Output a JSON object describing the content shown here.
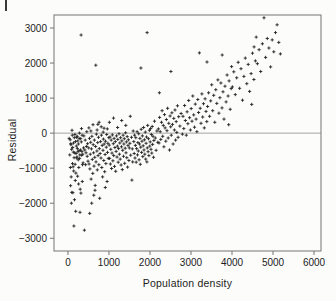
{
  "figure": {
    "background": "#fcfcfb",
    "corner_mark": ""
  },
  "chart_data": {
    "type": "scatter",
    "title": "",
    "xlabel": "Population density",
    "ylabel": "Residual",
    "xlim": [
      -340,
      6170
    ],
    "ylim": [
      -3363,
      3371
    ],
    "x_ticks": [
      0,
      1000,
      2000,
      3000,
      4000,
      5000,
      6000
    ],
    "y_ticks": [
      -3000,
      -2000,
      -1000,
      0,
      1000,
      2000,
      3000
    ],
    "x_tick_labels": [
      "0",
      "1000",
      "2000",
      "3000",
      "4000",
      "5000",
      "6000"
    ],
    "y_tick_labels": [
      "−3000",
      "−2000",
      "−1000",
      "0",
      "1000",
      "2000",
      "3000"
    ],
    "reference_line_y": 0,
    "grid": false,
    "legend": null,
    "marker": "plus",
    "marker_color": "#232323",
    "axis_color": "#757575",
    "text_color": "#1c1c1c",
    "points": [
      [
        30,
        -150
      ],
      [
        45,
        -620
      ],
      [
        55,
        -190
      ],
      [
        60,
        -980
      ],
      [
        65,
        -1500
      ],
      [
        70,
        -300
      ],
      [
        75,
        -330
      ],
      [
        80,
        -1250
      ],
      [
        85,
        -2000
      ],
      [
        90,
        -460
      ],
      [
        95,
        -1690
      ],
      [
        100,
        80
      ],
      [
        105,
        -60
      ],
      [
        110,
        -870
      ],
      [
        115,
        -410
      ],
      [
        120,
        -1700
      ],
      [
        125,
        -960
      ],
      [
        130,
        -540
      ],
      [
        135,
        -280
      ],
      [
        140,
        -1080
      ],
      [
        145,
        -2650
      ],
      [
        150,
        -700
      ],
      [
        155,
        -130
      ],
      [
        160,
        -1900
      ],
      [
        165,
        -560
      ],
      [
        170,
        -40
      ],
      [
        175,
        -890
      ],
      [
        180,
        -1350
      ],
      [
        185,
        -240
      ],
      [
        190,
        -2230
      ],
      [
        195,
        -1140
      ],
      [
        200,
        -580
      ],
      [
        205,
        -370
      ],
      [
        210,
        -120
      ],
      [
        215,
        -710
      ],
      [
        220,
        -680
      ],
      [
        225,
        -90
      ],
      [
        230,
        -440
      ],
      [
        235,
        -1230
      ],
      [
        240,
        -220
      ],
      [
        245,
        -530
      ],
      [
        250,
        -760
      ],
      [
        255,
        -310
      ],
      [
        260,
        -1450
      ],
      [
        265,
        -980
      ],
      [
        270,
        -500
      ],
      [
        275,
        -150
      ],
      [
        280,
        0
      ],
      [
        285,
        -720
      ],
      [
        290,
        -620
      ],
      [
        295,
        -2260
      ],
      [
        300,
        -1600
      ],
      [
        305,
        -480
      ],
      [
        310,
        -160
      ],
      [
        315,
        -1710
      ],
      [
        320,
        2800
      ],
      [
        325,
        -250
      ],
      [
        330,
        130
      ],
      [
        335,
        -630
      ],
      [
        340,
        -520
      ],
      [
        345,
        -60
      ],
      [
        350,
        -1380
      ],
      [
        355,
        -900
      ],
      [
        360,
        -600
      ],
      [
        370,
        -850
      ],
      [
        380,
        -420
      ],
      [
        390,
        -80
      ],
      [
        400,
        -2770
      ],
      [
        410,
        -480
      ],
      [
        420,
        -200
      ],
      [
        430,
        -900
      ],
      [
        440,
        -560
      ],
      [
        450,
        -380
      ],
      [
        460,
        40
      ],
      [
        470,
        -660
      ],
      [
        480,
        -300
      ],
      [
        490,
        -800
      ],
      [
        505,
        -420
      ],
      [
        510,
        150
      ],
      [
        515,
        -880
      ],
      [
        525,
        -150
      ],
      [
        530,
        -2290
      ],
      [
        535,
        -1020
      ],
      [
        545,
        -600
      ],
      [
        555,
        -260
      ],
      [
        560,
        60
      ],
      [
        565,
        -1310
      ],
      [
        575,
        -450
      ],
      [
        580,
        -2000
      ],
      [
        585,
        -90
      ],
      [
        595,
        -750
      ],
      [
        605,
        -1150
      ],
      [
        610,
        240
      ],
      [
        615,
        -330
      ],
      [
        625,
        -560
      ],
      [
        630,
        -1770
      ],
      [
        635,
        -940
      ],
      [
        645,
        -200
      ],
      [
        655,
        -690
      ],
      [
        660,
        -1630
      ],
      [
        665,
        -1490
      ],
      [
        675,
        -380
      ],
      [
        680,
        1940
      ],
      [
        685,
        -820
      ],
      [
        695,
        -30
      ],
      [
        705,
        -510
      ],
      [
        710,
        90
      ],
      [
        715,
        -1050
      ],
      [
        725,
        -270
      ],
      [
        730,
        250
      ],
      [
        735,
        -640
      ],
      [
        745,
        -120
      ],
      [
        755,
        -900
      ],
      [
        760,
        310
      ],
      [
        765,
        -440
      ],
      [
        775,
        -1860
      ],
      [
        785,
        -580
      ],
      [
        795,
        -240
      ],
      [
        805,
        -710
      ],
      [
        810,
        180
      ],
      [
        815,
        -60
      ],
      [
        825,
        -980
      ],
      [
        835,
        -350
      ],
      [
        845,
        -1250
      ],
      [
        855,
        -490
      ],
      [
        860,
        30
      ],
      [
        865,
        -170
      ],
      [
        875,
        -780
      ],
      [
        880,
        140
      ],
      [
        885,
        -310
      ],
      [
        895,
        -1100
      ],
      [
        905,
        -610
      ],
      [
        910,
        -1550
      ],
      [
        915,
        -230
      ],
      [
        925,
        -870
      ],
      [
        935,
        -400
      ],
      [
        945,
        -40
      ],
      [
        955,
        -1380
      ],
      [
        960,
        120
      ],
      [
        965,
        -550
      ],
      [
        975,
        -290
      ],
      [
        985,
        -720
      ],
      [
        995,
        -130
      ],
      [
        1005,
        -340
      ],
      [
        1010,
        310
      ],
      [
        1015,
        -720
      ],
      [
        1025,
        -110
      ],
      [
        1035,
        -880
      ],
      [
        1045,
        -460
      ],
      [
        1055,
        -200
      ],
      [
        1065,
        -1010
      ],
      [
        1075,
        -570
      ],
      [
        1085,
        -50
      ],
      [
        1095,
        -790
      ],
      [
        1105,
        -300
      ],
      [
        1110,
        430
      ],
      [
        1115,
        -640
      ],
      [
        1125,
        -150
      ],
      [
        1135,
        -950
      ],
      [
        1145,
        -410
      ],
      [
        1155,
        -240
      ],
      [
        1165,
        -1090
      ],
      [
        1175,
        -520
      ],
      [
        1185,
        -80
      ],
      [
        1195,
        -680
      ],
      [
        1205,
        -370
      ],
      [
        1210,
        160
      ],
      [
        1215,
        -180
      ],
      [
        1225,
        -830
      ],
      [
        1235,
        -440
      ],
      [
        1245,
        -20
      ],
      [
        1255,
        -600
      ],
      [
        1265,
        -280
      ],
      [
        1275,
        -740
      ],
      [
        1285,
        -130
      ],
      [
        1295,
        -910
      ],
      [
        1305,
        -390
      ],
      [
        1310,
        360
      ],
      [
        1315,
        -220
      ],
      [
        1325,
        -1040
      ],
      [
        1335,
        -490
      ],
      [
        1345,
        -60
      ],
      [
        1355,
        -660
      ],
      [
        1365,
        -310
      ],
      [
        1375,
        -160
      ],
      [
        1385,
        -860
      ],
      [
        1395,
        -430
      ],
      [
        1405,
        10
      ],
      [
        1410,
        220
      ],
      [
        1415,
        -560
      ],
      [
        1425,
        -250
      ],
      [
        1435,
        -700
      ],
      [
        1445,
        -100
      ],
      [
        1455,
        -970
      ],
      [
        1465,
        -350
      ],
      [
        1475,
        -190
      ],
      [
        1485,
        -780
      ],
      [
        1495,
        -420
      ],
      [
        1510,
        -290
      ],
      [
        1520,
        480
      ],
      [
        1530,
        -630
      ],
      [
        1550,
        -120
      ],
      [
        1560,
        -1340
      ],
      [
        1570,
        -450
      ],
      [
        1580,
        -820
      ],
      [
        1590,
        60
      ],
      [
        1605,
        -240
      ],
      [
        1615,
        -580
      ],
      [
        1625,
        -60
      ],
      [
        1635,
        -710
      ],
      [
        1645,
        -350
      ],
      [
        1655,
        -130
      ],
      [
        1665,
        -830
      ],
      [
        1675,
        -440
      ],
      [
        1685,
        40
      ],
      [
        1695,
        -620
      ],
      [
        1705,
        -270
      ],
      [
        1715,
        -510
      ],
      [
        1725,
        -20
      ],
      [
        1735,
        -760
      ],
      [
        1745,
        -310
      ],
      [
        1755,
        -150
      ],
      [
        1765,
        -890
      ],
      [
        1775,
        -400
      ],
      [
        1780,
        1860
      ],
      [
        1785,
        110
      ],
      [
        1795,
        -550
      ],
      [
        1805,
        -230
      ],
      [
        1815,
        -80
      ],
      [
        1825,
        -670
      ],
      [
        1835,
        -360
      ],
      [
        1845,
        160
      ],
      [
        1855,
        -480
      ],
      [
        1865,
        -190
      ],
      [
        1875,
        -600
      ],
      [
        1885,
        30
      ],
      [
        1895,
        -740
      ],
      [
        1905,
        -290
      ],
      [
        1915,
        -110
      ],
      [
        1925,
        -820
      ],
      [
        1930,
        2870
      ],
      [
        1935,
        -420
      ],
      [
        1945,
        220
      ],
      [
        1955,
        -530
      ],
      [
        1965,
        -160
      ],
      [
        1975,
        -640
      ],
      [
        1985,
        80
      ],
      [
        1995,
        -370
      ],
      [
        2005,
        -250
      ],
      [
        2015,
        130
      ],
      [
        2025,
        -460
      ],
      [
        2035,
        -40
      ],
      [
        2045,
        -570
      ],
      [
        2055,
        190
      ],
      [
        2065,
        -320
      ],
      [
        2075,
        -90
      ],
      [
        2085,
        -690
      ],
      [
        2095,
        -210
      ],
      [
        2110,
        340
      ],
      [
        2130,
        -140
      ],
      [
        2150,
        -490
      ],
      [
        2170,
        60
      ],
      [
        2190,
        -260
      ],
      [
        2205,
        120
      ],
      [
        2220,
        -280
      ],
      [
        2230,
        1150
      ],
      [
        2235,
        450
      ],
      [
        2250,
        40
      ],
      [
        2265,
        -180
      ],
      [
        2280,
        310
      ],
      [
        2295,
        640
      ],
      [
        2310,
        -90
      ],
      [
        2325,
        220
      ],
      [
        2340,
        -390
      ],
      [
        2355,
        530
      ],
      [
        2370,
        150
      ],
      [
        2385,
        -230
      ],
      [
        2400,
        390
      ],
      [
        2415,
        70
      ],
      [
        2430,
        710
      ],
      [
        2445,
        -140
      ],
      [
        2460,
        280
      ],
      [
        2475,
        -480
      ],
      [
        2490,
        490
      ],
      [
        2505,
        180
      ],
      [
        2510,
        1760
      ],
      [
        2520,
        -60
      ],
      [
        2535,
        580
      ],
      [
        2550,
        250
      ],
      [
        2565,
        -310
      ],
      [
        2580,
        420
      ],
      [
        2595,
        90
      ],
      [
        2610,
        660
      ],
      [
        2625,
        -200
      ],
      [
        2640,
        330
      ],
      [
        2655,
        20
      ],
      [
        2670,
        780
      ],
      [
        2685,
        -120
      ],
      [
        2700,
        470
      ],
      [
        2730,
        200
      ],
      [
        2760,
        560
      ],
      [
        2790,
        -30
      ],
      [
        2805,
        480
      ],
      [
        2825,
        130
      ],
      [
        2845,
        790
      ],
      [
        2865,
        360
      ],
      [
        2885,
        -60
      ],
      [
        2905,
        610
      ],
      [
        2925,
        270
      ],
      [
        2945,
        930
      ],
      [
        2965,
        440
      ],
      [
        2985,
        90
      ],
      [
        3005,
        700
      ],
      [
        3025,
        340
      ],
      [
        3045,
        1060
      ],
      [
        3065,
        520
      ],
      [
        3085,
        170
      ],
      [
        3105,
        830
      ],
      [
        3125,
        400
      ],
      [
        3145,
        40
      ],
      [
        3165,
        960
      ],
      [
        3185,
        590
      ],
      [
        3205,
        2290
      ],
      [
        3225,
        710
      ],
      [
        3245,
        280
      ],
      [
        3265,
        1120
      ],
      [
        3285,
        460
      ],
      [
        3305,
        840
      ],
      [
        3325,
        150
      ],
      [
        3345,
        980
      ],
      [
        3365,
        620
      ],
      [
        3385,
        330
      ],
      [
        3390,
        2030
      ],
      [
        3405,
        760
      ],
      [
        3430,
        1150
      ],
      [
        3455,
        480
      ],
      [
        3480,
        920
      ],
      [
        3505,
        1380
      ],
      [
        3530,
        640
      ],
      [
        3555,
        1080
      ],
      [
        3580,
        310
      ],
      [
        3605,
        1240
      ],
      [
        3630,
        850
      ],
      [
        3655,
        1520
      ],
      [
        3680,
        570
      ],
      [
        3705,
        1010
      ],
      [
        3730,
        1430
      ],
      [
        3755,
        720
      ],
      [
        3760,
        2230
      ],
      [
        3780,
        1180
      ],
      [
        3805,
        400
      ],
      [
        3830,
        1340
      ],
      [
        3855,
        890
      ],
      [
        3880,
        1660
      ],
      [
        3905,
        1060
      ],
      [
        3920,
        240
      ],
      [
        3930,
        1490
      ],
      [
        3955,
        680
      ],
      [
        3980,
        1270
      ],
      [
        3990,
        1900
      ],
      [
        4010,
        1320
      ],
      [
        4045,
        1750
      ],
      [
        4080,
        1100
      ],
      [
        4115,
        1580
      ],
      [
        4150,
        2020
      ],
      [
        4185,
        1280
      ],
      [
        4220,
        1840
      ],
      [
        4255,
        940
      ],
      [
        4290,
        1620
      ],
      [
        4325,
        2140
      ],
      [
        4360,
        1410
      ],
      [
        4395,
        1960
      ],
      [
        4430,
        1190
      ],
      [
        4465,
        1700
      ],
      [
        4480,
        820
      ],
      [
        4500,
        2280
      ],
      [
        4535,
        1530
      ],
      [
        4540,
        2460
      ],
      [
        4570,
        2060
      ],
      [
        4590,
        2740
      ],
      [
        4620,
        1980
      ],
      [
        4660,
        2380
      ],
      [
        4700,
        1760
      ],
      [
        4740,
        2550
      ],
      [
        4780,
        3290
      ],
      [
        4820,
        2160
      ],
      [
        4860,
        2700
      ],
      [
        4900,
        2430
      ],
      [
        4940,
        1890
      ],
      [
        4980,
        2660
      ],
      [
        5020,
        2320
      ],
      [
        5060,
        2870
      ],
      [
        5100,
        3090
      ],
      [
        5140,
        2590
      ],
      [
        5180,
        2260
      ]
    ]
  }
}
